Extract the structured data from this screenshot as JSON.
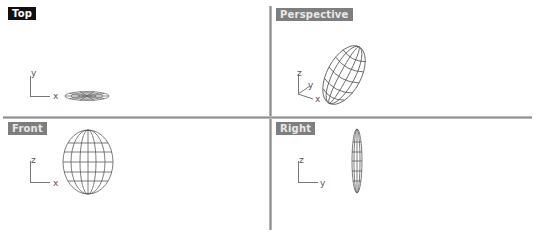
{
  "viewports": [
    {
      "id": "top",
      "label": "Top",
      "active": true,
      "axes": {
        "horizontal": "x",
        "vertical": "y"
      }
    },
    {
      "id": "perspective",
      "label": "Perspective",
      "active": false,
      "axes": {
        "x": "x",
        "y": "y",
        "z": "z"
      }
    },
    {
      "id": "front",
      "label": "Front",
      "active": false,
      "axes": {
        "horizontal": "x",
        "vertical": "z"
      }
    },
    {
      "id": "right",
      "label": "Right",
      "active": false,
      "axes": {
        "horizontal": "y",
        "vertical": "z"
      }
    }
  ],
  "colors": {
    "active_label_bg": "#111111",
    "inactive_label_bg": "#7e7e7e",
    "wireframe": "#5a5a5a",
    "axis": "#777777",
    "divider": "#8c8c8c"
  },
  "object": {
    "type": "ellipsoid-wireframe"
  }
}
